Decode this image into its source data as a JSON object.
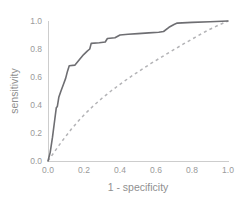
{
  "chart_data": {
    "type": "line",
    "title": "",
    "xlabel": "1 - specificity",
    "ylabel": "sensitivity",
    "xlim": [
      0.0,
      1.0
    ],
    "ylim": [
      0.0,
      1.0
    ],
    "grid": false,
    "legend": "none",
    "xticks": [
      "0.0",
      "0.2",
      "0.4",
      "0.6",
      "0.8",
      "1.0"
    ],
    "xtick_values": [
      0.0,
      0.2,
      0.4,
      0.6,
      0.8,
      1.0
    ],
    "yticks": [
      "0.0",
      "0.2",
      "0.4",
      "0.6",
      "0.8",
      "1.0"
    ],
    "ytick_values": [
      0.0,
      0.2,
      0.4,
      0.6,
      0.8,
      1.0
    ],
    "series": [
      {
        "name": "roc-curve-solid",
        "style": "solid",
        "color": "#6e6e72",
        "points": [
          [
            0.0,
            0.0
          ],
          [
            0.012,
            0.06
          ],
          [
            0.025,
            0.17
          ],
          [
            0.038,
            0.3
          ],
          [
            0.046,
            0.38
          ],
          [
            0.052,
            0.39
          ],
          [
            0.06,
            0.455
          ],
          [
            0.072,
            0.5
          ],
          [
            0.085,
            0.545
          ],
          [
            0.098,
            0.59
          ],
          [
            0.108,
            0.64
          ],
          [
            0.118,
            0.68
          ],
          [
            0.15,
            0.685
          ],
          [
            0.175,
            0.725
          ],
          [
            0.198,
            0.76
          ],
          [
            0.218,
            0.785
          ],
          [
            0.232,
            0.8
          ],
          [
            0.24,
            0.84
          ],
          [
            0.285,
            0.845
          ],
          [
            0.318,
            0.85
          ],
          [
            0.33,
            0.875
          ],
          [
            0.372,
            0.88
          ],
          [
            0.4,
            0.9
          ],
          [
            0.445,
            0.905
          ],
          [
            0.5,
            0.91
          ],
          [
            0.56,
            0.915
          ],
          [
            0.615,
            0.92
          ],
          [
            0.642,
            0.925
          ],
          [
            0.672,
            0.955
          ],
          [
            0.7,
            0.975
          ],
          [
            0.718,
            0.985
          ],
          [
            0.8,
            0.99
          ],
          [
            0.9,
            0.995
          ],
          [
            1.0,
            1.0
          ]
        ]
      },
      {
        "name": "roc-curve-dashed",
        "style": "dashed",
        "color": "#b3b3b6",
        "points": [
          [
            0.0,
            0.0
          ],
          [
            0.03,
            0.055
          ],
          [
            0.06,
            0.11
          ],
          [
            0.095,
            0.17
          ],
          [
            0.13,
            0.228
          ],
          [
            0.17,
            0.288
          ],
          [
            0.21,
            0.342
          ],
          [
            0.255,
            0.398
          ],
          [
            0.3,
            0.448
          ],
          [
            0.35,
            0.5
          ],
          [
            0.4,
            0.548
          ],
          [
            0.455,
            0.598
          ],
          [
            0.51,
            0.645
          ],
          [
            0.57,
            0.695
          ],
          [
            0.63,
            0.742
          ],
          [
            0.69,
            0.788
          ],
          [
            0.755,
            0.838
          ],
          [
            0.82,
            0.885
          ],
          [
            0.89,
            0.935
          ],
          [
            0.95,
            0.972
          ],
          [
            1.0,
            1.0
          ]
        ]
      }
    ]
  }
}
